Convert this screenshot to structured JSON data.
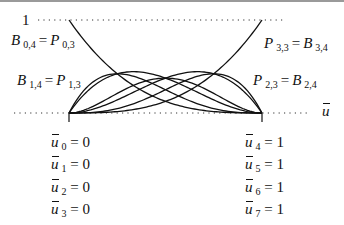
{
  "diagram": {
    "type": "bernstein-basis-functions",
    "y_top_label": "1",
    "axis_label": "u",
    "labels": {
      "b04": {
        "left": "B",
        "left_sub": "0,4",
        "eq": "=",
        "right": "P",
        "right_sub": "0,3"
      },
      "b14": {
        "left": "B",
        "left_sub": "1,4",
        "eq": "=",
        "right": "P",
        "right_sub": "1,3"
      },
      "p33": {
        "left": "P",
        "left_sub": "3,3",
        "eq": "=",
        "right": "B",
        "right_sub": "3,4"
      },
      "p23": {
        "left": "P",
        "left_sub": "2,3",
        "eq": "=",
        "right": "B",
        "right_sub": "2,4"
      }
    },
    "knots_left": [
      {
        "sym": "u",
        "sub": "0",
        "value": "= 0"
      },
      {
        "sym": "u",
        "sub": "1",
        "value": "= 0"
      },
      {
        "sym": "u",
        "sub": "2",
        "value": "= 0"
      },
      {
        "sym": "u",
        "sub": "3",
        "value": "= 0"
      }
    ],
    "knots_right": [
      {
        "sym": "u",
        "sub": "4",
        "value": "= 1"
      },
      {
        "sym": "u",
        "sub": "5",
        "value": "= 1"
      },
      {
        "sym": "u",
        "sub": "6",
        "value": "= 1"
      },
      {
        "sym": "u",
        "sub": "7",
        "value": "= 1"
      }
    ],
    "curves": [
      "B0,3 (1-u)^3",
      "B1,3 3u(1-u)^2",
      "B2,3 3u^2(1-u)",
      "B3,3 u^3",
      "B1,4 4u(1-u)^3",
      "B2,4 6u^2(1-u)^2",
      "B3,4 4u^3(1-u)"
    ],
    "colors": {
      "line": "#111111",
      "dots": "#333333",
      "border": "#9a9a9a"
    }
  }
}
